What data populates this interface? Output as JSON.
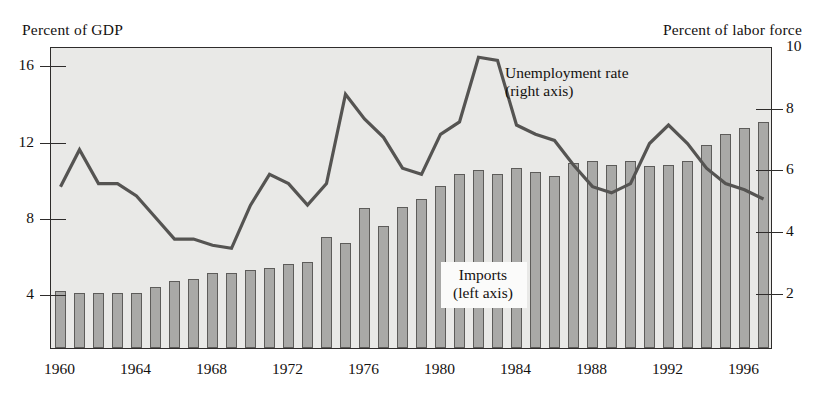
{
  "figure": {
    "left_axis_title": "Percent of GDP",
    "right_axis_title": "Percent of labor force",
    "annotations": {
      "unemployment_line1": "Unemployment rate",
      "unemployment_line2": "(right axis)",
      "imports_line1": "Imports",
      "imports_line2": "(left axis)"
    },
    "colors": {
      "plot_background": "#e9e9e7",
      "bar_fill": "#a9a9a7",
      "bar_stroke": "#5d5c5a",
      "line_stroke": "#555452",
      "frame": "#2e2c2b",
      "text": "#14110f",
      "label_box": "#fbfbfa"
    }
  },
  "chart_data": {
    "type": "bar",
    "title": "",
    "subtitle": "",
    "xlabel": "",
    "ylabel": "Percent of GDP",
    "y2label": "Percent of labor force",
    "grid": false,
    "legend_position": "in-plot",
    "x": [
      1960,
      1961,
      1962,
      1963,
      1964,
      1965,
      1966,
      1967,
      1968,
      1969,
      1970,
      1971,
      1972,
      1973,
      1974,
      1975,
      1976,
      1977,
      1978,
      1979,
      1980,
      1981,
      1982,
      1983,
      1984,
      1985,
      1986,
      1987,
      1988,
      1989,
      1990,
      1991,
      1992,
      1993,
      1994,
      1995,
      1996,
      1997
    ],
    "xtick_labels": [
      "1960",
      "1964",
      "1968",
      "1972",
      "1976",
      "1980",
      "1984",
      "1988",
      "1992",
      "1996"
    ],
    "xtick_values": [
      1960,
      1964,
      1968,
      1972,
      1976,
      1980,
      1984,
      1988,
      1992,
      1996
    ],
    "ytick_labels_left": [
      "4",
      "8",
      "12",
      "16"
    ],
    "ytick_values_left": [
      4,
      8,
      12,
      16
    ],
    "ytick_labels_right": [
      "2",
      "4",
      "6",
      "8",
      "10"
    ],
    "ytick_values_right": [
      2,
      4,
      6,
      8,
      10
    ],
    "ylim_left": [
      1.2,
      17.0
    ],
    "ylim_right": [
      0.2,
      10.0
    ],
    "series": [
      {
        "name": "Imports",
        "axis": "left",
        "type": "bar",
        "units": "Percent of GDP",
        "annotation": "Imports (left axis)",
        "values": [
          4.2,
          4.1,
          4.1,
          4.1,
          4.1,
          4.4,
          4.7,
          4.8,
          5.1,
          5.1,
          5.3,
          5.4,
          5.6,
          5.7,
          7.0,
          6.7,
          8.5,
          7.6,
          8.6,
          9.0,
          9.7,
          10.3,
          10.5,
          10.3,
          10.6,
          10.4,
          10.2,
          10.9,
          11.0,
          10.8,
          11.0,
          10.7,
          10.8,
          11.0,
          11.8,
          12.4,
          12.7,
          13.0
        ]
      },
      {
        "name": "Unemployment rate",
        "axis": "right",
        "type": "line",
        "units": "Percent of labor force",
        "annotation": "Unemployment rate (right axis)",
        "values": [
          5.5,
          6.7,
          5.6,
          5.6,
          5.2,
          4.5,
          3.8,
          3.8,
          3.6,
          3.5,
          4.9,
          5.9,
          5.6,
          4.9,
          5.6,
          8.5,
          7.7,
          7.1,
          6.1,
          5.9,
          7.2,
          7.6,
          9.7,
          9.6,
          7.5,
          7.2,
          7.0,
          6.2,
          5.5,
          5.3,
          5.6,
          6.9,
          7.5,
          6.9,
          6.1,
          5.6,
          5.4,
          5.1
        ]
      }
    ]
  }
}
